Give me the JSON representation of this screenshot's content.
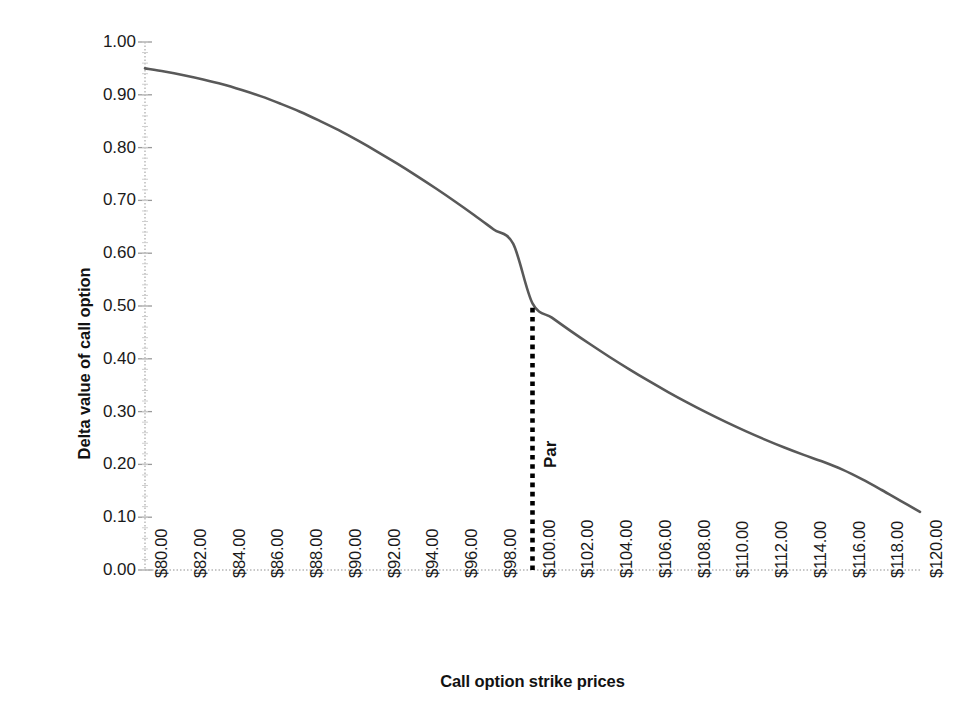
{
  "chart_data": {
    "type": "line",
    "title": "",
    "xlabel": "Call option strike prices",
    "ylabel": "Delta value of call option",
    "xlim": [
      80,
      120
    ],
    "ylim": [
      0,
      1
    ],
    "grid": false,
    "legend": "none",
    "x_tick_labels": [
      "$80.00",
      "$82.00",
      "$84.00",
      "$86.00",
      "$88.00",
      "$90.00",
      "$92.00",
      "$94.00",
      "$96.00",
      "$98.00",
      "$100.00",
      "$102.00",
      "$104.00",
      "$106.00",
      "$108.00",
      "$110.00",
      "$112.00",
      "$114.00",
      "$116.00",
      "$118.00",
      "$120.00"
    ],
    "x_tick_values": [
      80,
      82,
      84,
      86,
      88,
      90,
      92,
      94,
      96,
      98,
      100,
      102,
      104,
      106,
      108,
      110,
      112,
      114,
      116,
      118,
      120
    ],
    "y_tick_labels": [
      "1.00",
      "0.90",
      "0.80",
      "0.70",
      "0.60",
      "0.50",
      "0.40",
      "0.30",
      "0.20",
      "0.10",
      "0.00"
    ],
    "y_tick_values": [
      1.0,
      0.9,
      0.8,
      0.7,
      0.6,
      0.5,
      0.4,
      0.3,
      0.2,
      0.1,
      0.0
    ],
    "series": [
      {
        "name": "Delta value of call option",
        "color": "#595959",
        "x": [
          80,
          81,
          82,
          83,
          84,
          85,
          86,
          87,
          88,
          89,
          90,
          91,
          92,
          93,
          94,
          95,
          96,
          97,
          98,
          99,
          100,
          101,
          102,
          103,
          104,
          105,
          106,
          107,
          108,
          109,
          110,
          111,
          112,
          113,
          114,
          115,
          116,
          117,
          118,
          119,
          120
        ],
        "values": [
          0.95,
          0.944,
          0.937,
          0.929,
          0.92,
          0.909,
          0.897,
          0.883,
          0.868,
          0.851,
          0.833,
          0.813,
          0.792,
          0.77,
          0.747,
          0.723,
          0.698,
          0.672,
          0.645,
          0.618,
          0.505,
          0.478,
          0.452,
          0.427,
          0.403,
          0.38,
          0.358,
          0.337,
          0.317,
          0.298,
          0.28,
          0.263,
          0.247,
          0.232,
          0.218,
          0.205,
          0.19,
          0.172,
          0.152,
          0.131,
          0.11
        ]
      }
    ],
    "annotations": [
      {
        "label": "Par",
        "x": 100,
        "line_from_y": 0.0,
        "line_to_y": 0.505,
        "style": "dotted",
        "color": "#000000"
      }
    ]
  },
  "axis": {
    "y_title": "Delta value of call option",
    "x_title": "Call option strike prices"
  },
  "colors": {
    "series": "#595959",
    "axis_line": "#b5b5b5",
    "annotation": "#000000",
    "background": "#ffffff",
    "text": "#1a1a1a"
  }
}
